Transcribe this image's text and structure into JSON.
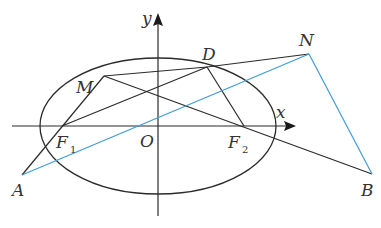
{
  "diagram": {
    "type": "geometry-ellipse",
    "colors": {
      "stroke": "#2b2b2b",
      "highlight": "#3f9bd6",
      "text": "#333333"
    },
    "axes": {
      "x_label": "x",
      "y_label": "y",
      "origin_label": "O"
    },
    "ellipse": {
      "cx": 158,
      "cy": 126,
      "rx": 118,
      "ry": 68
    },
    "points": {
      "A": {
        "label": "A",
        "x": 22,
        "y": 175
      },
      "B": {
        "label": "B",
        "x": 372,
        "y": 174
      },
      "D": {
        "label": "D",
        "x": 207,
        "y": 67
      },
      "M": {
        "label": "M",
        "x": 104,
        "y": 76
      },
      "N": {
        "label": "N",
        "x": 309,
        "y": 54
      },
      "O": {
        "label": "O",
        "x": 158,
        "y": 126
      },
      "F1": {
        "label": "F",
        "sub": "1",
        "x": 62,
        "y": 126
      },
      "F2": {
        "label": "F",
        "sub": "2",
        "x": 244,
        "y": 126
      }
    },
    "segments": [
      {
        "from": "A",
        "to": "M",
        "color": "stroke"
      },
      {
        "from": "F1",
        "to": "D",
        "color": "stroke"
      },
      {
        "from": "M",
        "to": "D",
        "color": "stroke"
      },
      {
        "from": "D",
        "to": "N",
        "color": "stroke"
      },
      {
        "from": "M",
        "to": "B",
        "color": "stroke"
      },
      {
        "from": "D",
        "to": "F2",
        "color": "stroke"
      },
      {
        "from": "A",
        "to": "N",
        "color": "highlight"
      },
      {
        "from": "N",
        "to": "B",
        "color": "highlight"
      }
    ]
  }
}
